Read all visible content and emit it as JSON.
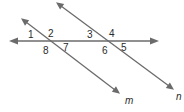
{
  "diagram": {
    "type": "parallel-lines-cut-by-transversal",
    "line_color": "#6b6b6b",
    "label_color": "#2a2a2a",
    "lines": [
      {
        "name": "transversal",
        "label": "",
        "x1": 11,
        "y1": 41,
        "x2": 157,
        "y2": 41,
        "arrows": "both"
      },
      {
        "name": "m",
        "label": "m",
        "x1": 22,
        "y1": 19,
        "x2": 119,
        "y2": 93,
        "arrows": "both"
      },
      {
        "name": "n",
        "label": "n",
        "x1": 57,
        "y1": 3,
        "x2": 173,
        "y2": 89,
        "arrows": "both"
      }
    ],
    "angle_labels": [
      {
        "label": "1",
        "x": 31,
        "y": 38
      },
      {
        "label": "2",
        "x": 50,
        "y": 37
      },
      {
        "label": "3",
        "x": 89,
        "y": 38
      },
      {
        "label": "4",
        "x": 111,
        "y": 37
      },
      {
        "label": "5",
        "x": 122,
        "y": 50
      },
      {
        "label": "6",
        "x": 103,
        "y": 54
      },
      {
        "label": "7",
        "x": 64,
        "y": 50
      },
      {
        "label": "8",
        "x": 44,
        "y": 54
      }
    ],
    "line_labels": [
      {
        "label": "m",
        "x": 126,
        "y": 104
      },
      {
        "label": "n",
        "x": 177,
        "y": 100
      }
    ]
  }
}
